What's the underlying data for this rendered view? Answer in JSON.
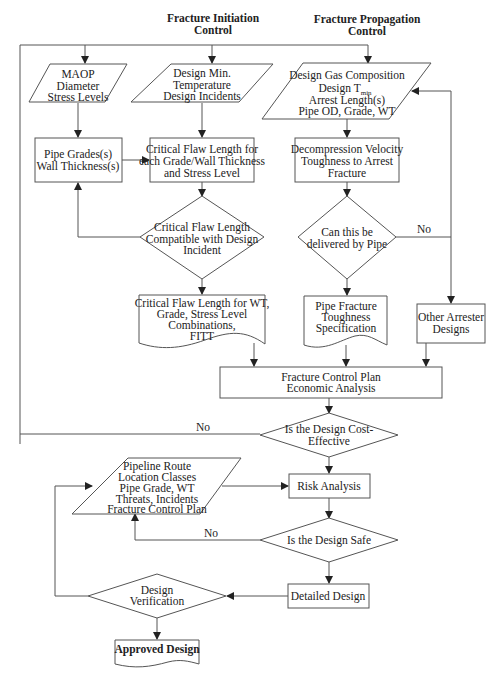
{
  "headers": {
    "initiation": [
      "Fracture Initiation",
      "Control"
    ],
    "propagation": [
      "Fracture Propagation",
      "Control"
    ]
  },
  "nodes": {
    "maop": [
      "MAOP",
      "Diameter",
      "Stress Levels"
    ],
    "design_min_temp": [
      "Design Min.",
      "Temperature",
      "Design Incidents"
    ],
    "design_gas": {
      "line1": "Design Gas Composition",
      "line2_main": "Design T",
      "line2_sub": "min",
      "line3": "Arrest Length(s)",
      "line4": "Pipe OD, Grade, WT"
    },
    "pipe_grades": [
      "Pipe Grades(s)",
      "Wall Thickness(s)"
    ],
    "critical_flaw_length": [
      "Critical Flaw Length for",
      "each Grade/Wall Thickness",
      "and Stress Level"
    ],
    "decompression": [
      "Decompression Velocity",
      "Toughness to Arrest",
      "Fracture"
    ],
    "critical_flaw_compatible": [
      "Critical Flaw Length",
      "Compatible with Design",
      "Incident"
    ],
    "can_be_delivered": [
      "Can this be",
      "delivered by Pipe"
    ],
    "critical_flaw_combos": [
      "Critical Flaw Length for WT,",
      "Grade, Stress Level",
      "Combinations,",
      "FITT"
    ],
    "pipe_fracture_toughness": [
      "Pipe Fracture",
      "Toughness",
      "Specification"
    ],
    "other_arrester": [
      "Other Arrester",
      "Designs"
    ],
    "fracture_control_plan": [
      "Fracture Control Plan",
      "Economic Analysis"
    ],
    "cost_effective": [
      "Is the Design Cost-",
      "Effective"
    ],
    "pipeline_route": [
      "Pipeline Route",
      "Location Classes",
      "Pipe Grade, WT",
      "Threats, Incidents",
      "Fracture Control Plan"
    ],
    "risk_analysis": [
      "Risk Analysis"
    ],
    "design_safe": [
      "Is the Design Safe"
    ],
    "detailed_design": [
      "Detailed Design"
    ],
    "design_verification": [
      "Design",
      "Verification"
    ],
    "approved_design": [
      "Approved Design"
    ]
  },
  "edge_labels": {
    "no_delivered": "No",
    "no_cost": "No",
    "no_safe": "No"
  }
}
